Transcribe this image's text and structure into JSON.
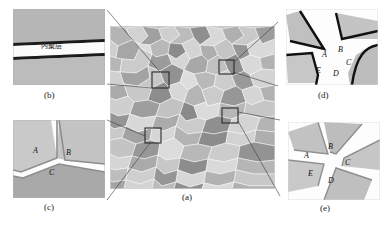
{
  "figure": {
    "caption_style": "parenthesized-letters",
    "panels": [
      {
        "id": "a",
        "label": "(a)",
        "name": "polycrystalline-microstructure",
        "description": "Polycrystalline grain microstructure with four highlighted inspection boxes"
      },
      {
        "id": "b",
        "label": "(b)",
        "name": "cohesive-layer-inset",
        "annotation_cjk": "内聚层"
      },
      {
        "id": "c",
        "label": "(c)",
        "name": "triple-junction-inset",
        "grain_labels": [
          "A",
          "B",
          "C"
        ]
      },
      {
        "id": "d",
        "label": "(d)",
        "name": "separated-grain-junction-inset",
        "grain_labels": [
          "A",
          "B",
          "C",
          "D",
          "E"
        ]
      },
      {
        "id": "e",
        "label": "(e)",
        "name": "five-grain-junction-inset",
        "grain_labels": [
          "A",
          "B",
          "C",
          "D",
          "E"
        ]
      }
    ],
    "colors": {
      "background": "#ffffff",
      "grain_light": "#d9d9d9",
      "grain_mid": "#bfbfbf",
      "grain_dark": "#9a9a9a",
      "boundary_black": "#111111",
      "cohesive_white": "#fdfdfd",
      "leader_line": "#3b3b3b"
    }
  },
  "panel_a": {
    "label": "(a)",
    "boxes": [
      {
        "name": "box-upper-left",
        "x": 152,
        "y": 72,
        "w": 17,
        "h": 16
      },
      {
        "name": "box-upper-right",
        "x": 219,
        "y": 60,
        "w": 15,
        "h": 14
      },
      {
        "name": "box-lower-left",
        "x": 145,
        "y": 128,
        "w": 16,
        "h": 15
      },
      {
        "name": "box-lower-right",
        "x": 222,
        "y": 108,
        "w": 16,
        "h": 15
      }
    ]
  },
  "panel_b": {
    "label": "(b)",
    "annotation": "内聚层"
  },
  "panel_c": {
    "label": "(c)",
    "labels": [
      {
        "text": "A",
        "x": 33,
        "y": 150
      },
      {
        "text": "B",
        "x": 66,
        "y": 152
      },
      {
        "text": "C",
        "x": 49,
        "y": 172
      }
    ]
  },
  "panel_d": {
    "label": "(d)",
    "labels": [
      {
        "text": "A",
        "x": 322,
        "y": 54
      },
      {
        "text": "B",
        "x": 338,
        "y": 49
      },
      {
        "text": "C",
        "x": 345,
        "y": 61
      },
      {
        "text": "D",
        "x": 333,
        "y": 73
      },
      {
        "text": "E",
        "x": 316,
        "y": 70
      }
    ]
  },
  "panel_e": {
    "label": "(e)",
    "labels": [
      {
        "text": "A",
        "x": 304,
        "y": 155
      },
      {
        "text": "B",
        "x": 327,
        "y": 146
      },
      {
        "text": "C",
        "x": 344,
        "y": 162
      },
      {
        "text": "D",
        "x": 327,
        "y": 180
      },
      {
        "text": "E",
        "x": 308,
        "y": 173
      }
    ]
  }
}
